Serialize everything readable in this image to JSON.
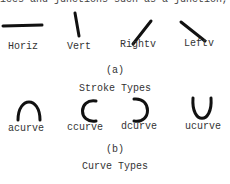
{
  "top_fragment": "ices and junctions such as a junction,",
  "figure_a": {
    "strokes": [
      {
        "label": "Horiz"
      },
      {
        "label": "Vert"
      },
      {
        "label": "Rightv"
      },
      {
        "label": "Leftv"
      }
    ],
    "panel_label": "(a)",
    "caption": "Stroke Types"
  },
  "figure_b": {
    "curves": [
      {
        "label": "acurve"
      },
      {
        "label": "ccurve"
      },
      {
        "label": "dcurve"
      },
      {
        "label": "ucurve"
      }
    ],
    "panel_label": "(b)",
    "caption": "Curve Types"
  }
}
